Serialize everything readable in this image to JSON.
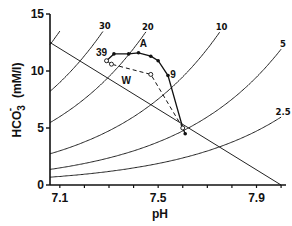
{
  "chart_data": {
    "type": "line",
    "title": "",
    "xlabel": "pH",
    "ylabel": "HCO3- (mM/l)",
    "ylabel_main": "HCO",
    "ylabel_sub": "3",
    "ylabel_sup": "-",
    "ylabel_units": "(mM/l)",
    "xlim": [
      7.06,
      8.02
    ],
    "ylim": [
      0,
      15
    ],
    "x_ticks": [
      7.1,
      7.2,
      7.3,
      7.4,
      7.5,
      7.6,
      7.7,
      7.8,
      7.9,
      8.0
    ],
    "x_tick_labels": [
      {
        "value": 7.1,
        "label": "7.1"
      },
      {
        "value": 7.5,
        "label": "7.5"
      },
      {
        "value": 7.9,
        "label": "7.9"
      }
    ],
    "y_ticks": [
      0,
      5,
      10,
      15
    ],
    "y_tick_labels": [
      "0",
      "5",
      "10",
      "15"
    ],
    "grid": false,
    "isobars": [
      {
        "pco2": 30,
        "label": "30"
      },
      {
        "pco2": 20,
        "label": "20"
      },
      {
        "pco2": 10,
        "label": "10"
      },
      {
        "pco2": 5,
        "label": "5"
      },
      {
        "pco2": 2.5,
        "label": "2.5"
      }
    ],
    "isobar_minor": [
      45,
      60
    ],
    "buffer_line": {
      "x": [
        7.06,
        8.0
      ],
      "y": [
        12.5,
        0
      ]
    },
    "series": [
      {
        "name": "A",
        "style": "solid",
        "marker": "filled",
        "points": [
          {
            "x": 7.29,
            "y": 10.9,
            "label": "39"
          },
          {
            "x": 7.32,
            "y": 11.5
          },
          {
            "x": 7.38,
            "y": 11.5
          },
          {
            "x": 7.42,
            "y": 11.6
          },
          {
            "x": 7.47,
            "y": 11.3
          },
          {
            "x": 7.5,
            "y": 10.9
          },
          {
            "x": 7.54,
            "y": 9.6,
            "label": "9"
          },
          {
            "x": 7.6,
            "y": 5.0
          },
          {
            "x": 7.61,
            "y": 4.5
          }
        ]
      },
      {
        "name": "W",
        "style": "dashed",
        "marker": "open",
        "points": [
          {
            "x": 7.29,
            "y": 10.9
          },
          {
            "x": 7.31,
            "y": 10.6
          },
          {
            "x": 7.47,
            "y": 9.7
          },
          {
            "x": 7.6,
            "y": 5.0
          }
        ]
      }
    ],
    "annotations": [
      {
        "text": "A",
        "x": 7.44,
        "y": 12.1
      },
      {
        "text": "W",
        "x": 7.37,
        "y": 8.9
      },
      {
        "text": "39",
        "x": 7.27,
        "y": 11.3
      },
      {
        "text": "9",
        "x": 7.56,
        "y": 9.4
      }
    ]
  }
}
